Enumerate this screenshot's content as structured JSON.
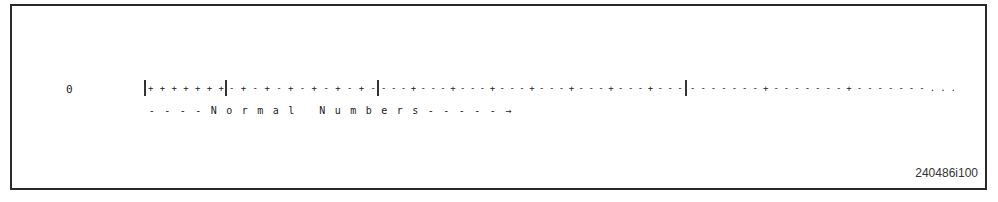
{
  "figure": {
    "zero_label": "0",
    "segments": [
      {
        "name": "denormal-region",
        "marks": [
          "+",
          "+",
          "+",
          "+",
          "+",
          "+",
          "+"
        ]
      },
      {
        "name": "normal-region-1",
        "marks": [
          "-",
          "+",
          "-",
          "+",
          "-",
          "+",
          "-",
          "+",
          "-",
          "+",
          "-",
          "+",
          "-"
        ]
      },
      {
        "name": "normal-region-2",
        "marks": [
          "-",
          "-",
          "-",
          "+",
          "-",
          "-",
          "-",
          "+",
          "-",
          "-",
          "-",
          "+",
          "-",
          "-",
          "-",
          "+",
          "-",
          "-",
          "-",
          "+",
          "-",
          "-",
          "-",
          "+",
          "-",
          "-",
          "-",
          "+",
          "-",
          "-",
          "-"
        ]
      },
      {
        "name": "normal-region-3",
        "marks": [
          "-",
          "-",
          "-",
          "-",
          "-",
          "-",
          "-",
          "+",
          "-",
          "-",
          "-",
          "-",
          "-",
          "-",
          "-",
          "+",
          "-",
          "-",
          "-",
          "-",
          "-",
          "-",
          "-",
          ".",
          ".",
          "."
        ]
      }
    ],
    "caption_chars": [
      "-",
      "-",
      "-",
      "-",
      "N",
      "o",
      "r",
      "m",
      "a",
      "l",
      "",
      "N",
      "u",
      "m",
      "b",
      "e",
      "r",
      "s",
      "-",
      "-",
      "-",
      "-",
      "-",
      "→"
    ],
    "caption_text": "----Normal Numbers-----→",
    "figure_id": "240486i100"
  }
}
